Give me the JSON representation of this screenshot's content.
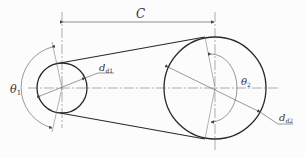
{
  "diagram": {
    "type": "belt-drive-geometry",
    "labels": {
      "center_distance": "C",
      "wrap_angle_small": "θ",
      "wrap_angle_small_sub": "1",
      "wrap_angle_large": "θ",
      "wrap_angle_large_sub": "2",
      "diameter_small": "d",
      "diameter_small_sub": "d1",
      "diameter_large": "d",
      "diameter_large_sub": "d2"
    },
    "colors": {
      "line": "#2a2a2a",
      "thin": "#555555",
      "background": "#fcfcfc"
    }
  }
}
